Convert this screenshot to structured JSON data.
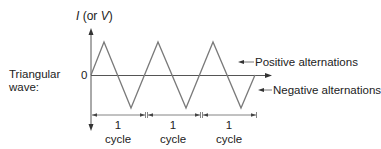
{
  "diagram": {
    "wave_label_line1": "Triangular",
    "wave_label_line2": "wave:",
    "axis_title_italic1": "I",
    "axis_title_middle": " (or ",
    "axis_title_italic2": "V",
    "axis_title_end": ")",
    "zero_label": "0",
    "positive_label": "Positive alternations",
    "negative_label": "Negative alternations",
    "cycles": [
      {
        "num": "1",
        "word": "cycle"
      },
      {
        "num": "1",
        "word": "cycle"
      },
      {
        "num": "1",
        "word": "cycle"
      }
    ],
    "line_color": "#7a7a7a",
    "axis_color": "#555555"
  }
}
